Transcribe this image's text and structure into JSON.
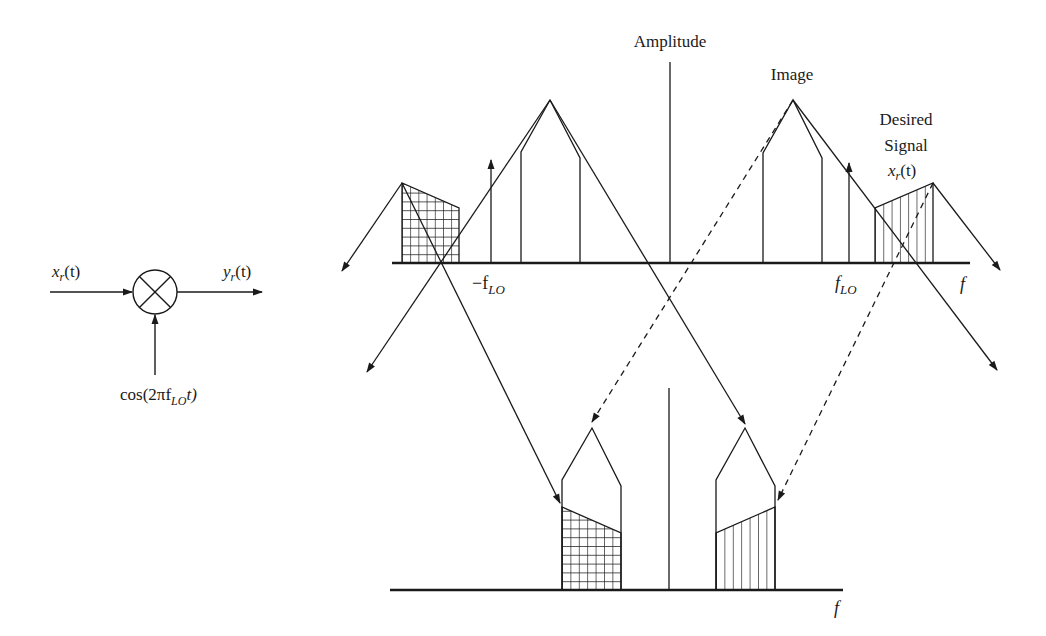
{
  "figure": {
    "type": "mixer frequency translation diagram",
    "colors": {
      "ink": "#1a1a1a",
      "background": "#ffffff"
    }
  },
  "mixer": {
    "input_label": "x",
    "input_sub": "r",
    "input_arg": "(t)",
    "output_label": "y",
    "output_sub": "r",
    "output_arg": "(t)",
    "lo_label_prefix": "cos(2πf",
    "lo_label_sub": "LO",
    "lo_label_suffix": "t)",
    "symbol": "multiplier-circle-x"
  },
  "top_spectrum": {
    "axis_label": "Amplitude",
    "freq_label": "f",
    "neg_lo_label": "−f",
    "neg_lo_sub": "LO",
    "pos_lo_label": "f",
    "pos_lo_sub": "LO",
    "image_label": "Image",
    "desired_line1": "Desired",
    "desired_line2": "Signal",
    "desired_sym": "x",
    "desired_sub": "r",
    "desired_arg": "(t)"
  },
  "bottom_spectrum": {
    "freq_label": "f"
  }
}
